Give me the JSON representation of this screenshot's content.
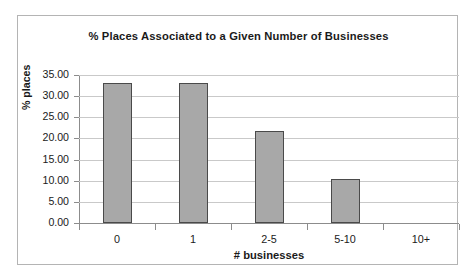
{
  "chart_data": {
    "type": "bar",
    "title": "% Places Associated to a Given Number of Businesses",
    "xlabel": "# businesses",
    "ylabel": "% places",
    "categories": [
      "0",
      "1",
      "2-5",
      "5-10",
      "10+"
    ],
    "values": [
      33.2,
      33.0,
      21.7,
      10.5,
      0
    ],
    "ylim": [
      0,
      35
    ],
    "ytick_labels": [
      "35.00",
      "30.00",
      "25.00",
      "20.00",
      "15.00",
      "10.00",
      "5.00",
      "0.00"
    ],
    "ytick_values": [
      35,
      30,
      25,
      20,
      15,
      10,
      5,
      0
    ],
    "grid": "horizontal",
    "legend": "none",
    "series": [
      {
        "name": "% places",
        "values": [
          33.2,
          33.0,
          21.7,
          10.5,
          0
        ],
        "bar_color": "#a8a8a8",
        "bar_border_color": "#4a4a4a"
      }
    ],
    "colors": {
      "bar_fill": "#a8a8a8",
      "bar_outline": "#4a4a4a",
      "gridline": "#c9c9c9",
      "axis": "#8c8c8c",
      "frame": "#b4b4b4",
      "text": "#1a1a1a",
      "background": "#ffffff"
    }
  }
}
